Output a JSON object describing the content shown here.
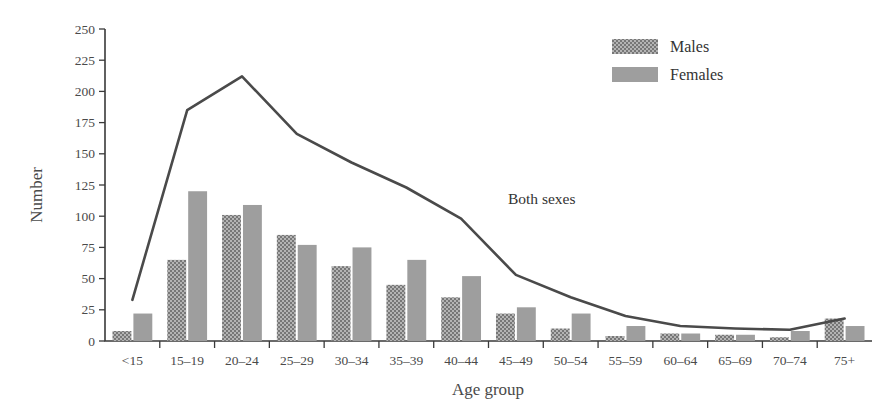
{
  "chart_data": {
    "type": "bar",
    "title": "",
    "subtitle": "",
    "xlabel": "Age group",
    "ylabel": "Number",
    "ylim": [
      0,
      250
    ],
    "ytick_step": 25,
    "yticks": [
      0,
      25,
      50,
      75,
      100,
      125,
      150,
      175,
      200,
      225,
      250
    ],
    "grid": false,
    "legend_position": "top-right",
    "categories": [
      "<15",
      "15–19",
      "20–24",
      "25–29",
      "30–34",
      "35–39",
      "40–44",
      "45–49",
      "50–54",
      "55–59",
      "60–64",
      "65–69",
      "70–74",
      "75+"
    ],
    "series": [
      {
        "name": "Males",
        "type": "bar",
        "color": "#8f8f8f",
        "pattern": "checker-dither",
        "values": [
          8,
          65,
          101,
          85,
          60,
          45,
          35,
          22,
          10,
          4,
          6,
          5,
          3,
          18
        ]
      },
      {
        "name": "Females",
        "type": "bar",
        "color": "#9c9c9c",
        "pattern": "solid",
        "values": [
          22,
          120,
          109,
          77,
          75,
          65,
          52,
          27,
          22,
          12,
          6,
          5,
          8,
          12
        ]
      },
      {
        "name": "Both sexes",
        "type": "line",
        "color": "#4a4a4a",
        "values": [
          33,
          185,
          212,
          166,
          143,
          123,
          98,
          53,
          35,
          20,
          12,
          10,
          9,
          18
        ]
      }
    ],
    "annotations": [
      {
        "text": "Both sexes",
        "x_category": "45–49",
        "value": 110
      }
    ]
  },
  "legend": {
    "items": [
      {
        "label": "Males",
        "swatch": "males-swatch"
      },
      {
        "label": "Females",
        "swatch": "females-swatch"
      }
    ]
  },
  "axes": {
    "y_title": "Number",
    "x_title": "Age group"
  }
}
